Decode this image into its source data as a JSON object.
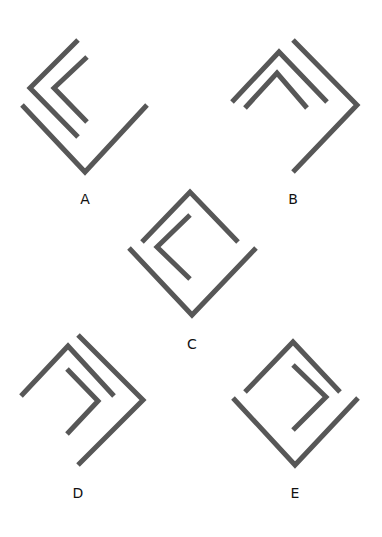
{
  "diagram": {
    "stroke_color": "#575757",
    "label_color": "#111111",
    "figures": [
      {
        "id": "A",
        "label": "A",
        "description": "Two nested left-pointing chevrons above a downward V"
      },
      {
        "id": "B",
        "label": "B",
        "description": "Two nested upward roof chevrons with a right-pointing chevron"
      },
      {
        "id": "C",
        "label": "C",
        "description": "Upward roof, inner left-pointing chevron, downward V forming a diamond"
      },
      {
        "id": "D",
        "label": "D",
        "description": "Upward roof with two nested right-pointing chevrons"
      },
      {
        "id": "E",
        "label": "E",
        "description": "Upward roof, inner right-pointing chevron, downward V forming a diamond"
      }
    ]
  }
}
